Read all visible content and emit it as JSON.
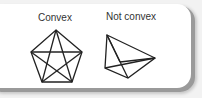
{
  "figure": {
    "labels": [
      "Convex",
      "Not convex"
    ],
    "shapes": [
      {
        "name": "convex-pentagon",
        "vertices": [
          [
            56,
            30
          ],
          [
            82,
            52
          ],
          [
            72,
            82
          ],
          [
            42,
            82
          ],
          [
            31,
            52
          ]
        ]
      },
      {
        "name": "non-convex-quadrilateral",
        "vertices": [
          [
            107,
            35
          ],
          [
            155,
            58
          ],
          [
            128,
            78
          ],
          [
            105,
            68
          ]
        ]
      }
    ],
    "colors": {
      "line": "#222222",
      "background": "#ffffff",
      "shadow": "#9a9a9a"
    }
  }
}
